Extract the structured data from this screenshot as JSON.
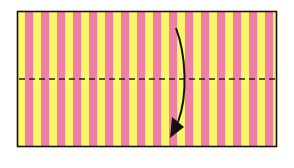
{
  "diagram": {
    "paper": {
      "x": 17,
      "y": 11,
      "width": 260,
      "height": 136,
      "stripe_colors": [
        "#fdf56a",
        "#f07fa6"
      ],
      "stripe_width": 8,
      "border_color": "#111111"
    },
    "fold_line": {
      "style": "dashed",
      "y": 79,
      "color": "#222222"
    },
    "arrow": {
      "direction": "down",
      "color": "#111111"
    }
  }
}
